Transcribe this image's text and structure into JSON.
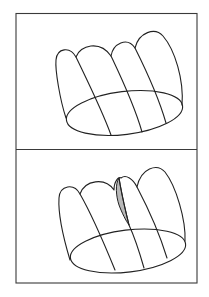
{
  "figure": {
    "type": "two-panel line diagram",
    "panels": [
      {
        "id": "top",
        "description": "Lobed cup-shaped surface with four rounded lobes over an elliptical base, ribs running from lobe junctions to the base",
        "lobe_count": 4,
        "shaded_region": false
      },
      {
        "id": "bottom",
        "description": "Same lobed surface with a narrow shaded sliver between the second and third lobes",
        "lobe_count": 4,
        "shaded_region": true
      }
    ],
    "colors": {
      "line": "#222222",
      "frame": "#3a3a3a",
      "shade": "#b8b8b8",
      "background": "#ffffff"
    }
  }
}
